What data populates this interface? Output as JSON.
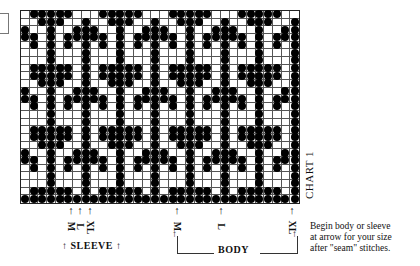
{
  "chart": {
    "label": "CHART 1",
    "columns": 32,
    "rows": 25,
    "repeat_width": 8,
    "row_patterns": {
      "R0": [
        1,
        2,
        3,
        4,
        5
      ],
      "A": [
        1,
        2,
        3,
        4,
        5,
        7
      ],
      "C": [
        2,
        3,
        4,
        7
      ],
      "D": [
        0,
        3,
        6,
        7
      ],
      "E": [
        0,
        1,
        3,
        5,
        6,
        7
      ],
      "F": [
        1,
        3,
        5,
        7
      ],
      "G": [
        3,
        7
      ],
      "FULL": [
        0,
        1,
        2,
        3,
        4,
        5,
        6,
        7
      ]
    },
    "row_sequence": [
      "R0",
      "C",
      "D",
      "E",
      "F",
      "G",
      "G",
      "A",
      "A",
      "C",
      "D",
      "E",
      "F",
      "G",
      "G",
      "A",
      "A",
      "C",
      "D",
      "E",
      "F",
      "G",
      "G",
      "A",
      "FULL"
    ],
    "symbol": "filled-dot",
    "colors": {
      "dot": "#000000",
      "grid": "#555555",
      "background": "#ffffff"
    }
  },
  "sleeve": {
    "label": "SLEEVE",
    "markers": [
      {
        "size": "M",
        "x": 71
      },
      {
        "size": "L",
        "x": 80
      },
      {
        "size": "XL",
        "x": 90
      }
    ]
  },
  "body": {
    "label": "BODY",
    "markers": [
      {
        "size": "M",
        "x": 177
      },
      {
        "size": "L",
        "x": 221
      },
      {
        "size": "XL",
        "x": 292
      }
    ]
  },
  "arrow_glyph": "↑",
  "note": {
    "lines": [
      "Begin body or sleeve",
      "at arrow for your size",
      "after \"seam\" stitches."
    ]
  }
}
